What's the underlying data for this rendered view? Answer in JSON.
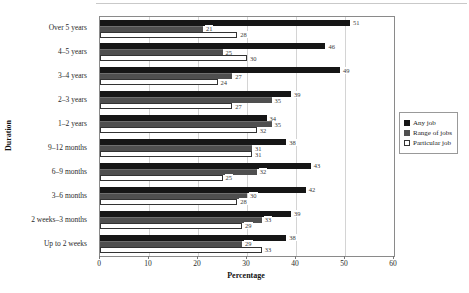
{
  "figure": {
    "xlabel": "Percentage",
    "ylabel": "Duration"
  },
  "colors": {
    "any_job": "#161616",
    "range_of_jobs": "#4f4f4f",
    "particular_job": "#ffffff",
    "gridline": "#d4d4d4",
    "plot_border": "#8a8a8a"
  },
  "chart_data": {
    "type": "bar",
    "orientation": "horizontal",
    "xlabel": "Percentage",
    "ylabel": "Duration",
    "xlim": [
      0,
      60
    ],
    "xticks": [
      0,
      10,
      20,
      30,
      40,
      50,
      60
    ],
    "grid": true,
    "legend_position": "right",
    "categories": [
      "Over 5 years",
      "4–5 years",
      "3–4 years",
      "2–3 years",
      "1–2 years",
      "9–12 months",
      "6–9 months",
      "3–6 months",
      "2 weeks–3 months",
      "Up to 2 weeks"
    ],
    "series": [
      {
        "name": "Any job",
        "color": "#161616",
        "values": [
          51,
          46,
          49,
          39,
          34,
          38,
          43,
          42,
          39,
          38
        ]
      },
      {
        "name": "Range of jobs",
        "color": "#4f4f4f",
        "values": [
          21,
          25,
          27,
          35,
          35,
          31,
          32,
          30,
          33,
          29
        ]
      },
      {
        "name": "Particular job",
        "color": "#ffffff",
        "values": [
          28,
          30,
          24,
          27,
          32,
          31,
          25,
          28,
          29,
          33
        ]
      }
    ]
  }
}
